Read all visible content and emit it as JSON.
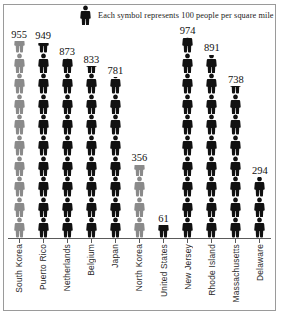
{
  "legend": {
    "text": "Each symbol represents 100 people per square mile",
    "symbol_icon": "person-icon",
    "unit_value": 100
  },
  "colors": {
    "black": "#111111",
    "gray": "#8a8a8a",
    "axis": "#5a5a5a",
    "frame": "#9a9a9a"
  },
  "chart_data": {
    "type": "bar",
    "title": "",
    "subtitle": "",
    "xlabel": "",
    "ylabel": "",
    "grid": false,
    "legend_position": "top",
    "unit_per_symbol": 100,
    "ylim": [
      0,
      1000
    ],
    "categories": [
      "South Korea",
      "Puerto Rico",
      "Netherlands",
      "Belgium",
      "Japan",
      "North Korea",
      "United States",
      "New Jersey",
      "Rhode Island",
      "Massachusetts",
      "Delaware"
    ],
    "values": [
      955,
      949,
      873,
      833,
      781,
      356,
      61,
      974,
      891,
      738,
      294
    ],
    "value_labels": [
      "955",
      "949",
      "873",
      "833",
      "781",
      "356",
      "61",
      "974",
      "891",
      "738",
      "294"
    ],
    "series": [
      {
        "name": "People per square mile",
        "values": [
          955,
          949,
          873,
          833,
          781,
          356,
          61,
          974,
          891,
          738,
          294
        ]
      }
    ],
    "point_colors": [
      "gray",
      "black",
      "black",
      "black",
      "black",
      "gray",
      "black",
      "black",
      "black",
      "black",
      "black"
    ]
  }
}
